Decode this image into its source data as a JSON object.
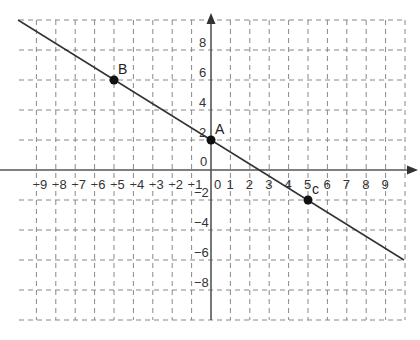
{
  "chart_data": {
    "type": "line",
    "title": "",
    "xlabel": "",
    "ylabel": "",
    "xlim": [
      -10,
      10
    ],
    "ylim": [
      -10,
      10
    ],
    "grid": true,
    "grid_style": "dashed",
    "x_ticks": [
      -9,
      -8,
      -7,
      -6,
      -5,
      -4,
      -3,
      -2,
      -1,
      0,
      1,
      2,
      3,
      4,
      5,
      6,
      7,
      8,
      9
    ],
    "x_tick_labels": [
      "-9",
      "-8",
      "-7",
      "-6",
      "-5",
      "-4",
      "-3",
      "-2",
      "-1",
      "0",
      "1",
      "2",
      "3",
      "4",
      "5",
      "6",
      "7",
      "8",
      "9"
    ],
    "y_ticks": [
      8,
      6,
      4,
      2,
      0,
      -2,
      -4,
      -6,
      -8
    ],
    "y_tick_labels": [
      "8",
      "6",
      "4",
      "2",
      "0",
      "-2",
      "-4",
      "-6",
      "-8"
    ],
    "series": [
      {
        "name": "line",
        "equation": "y = -0.8x + 2",
        "x": [
          -10,
          10
        ],
        "y": [
          10,
          -6
        ]
      }
    ],
    "points": [
      {
        "label": "A",
        "x": 0,
        "y": 2
      },
      {
        "label": "B",
        "x": -5,
        "y": 6
      },
      {
        "label": "C",
        "x": 5,
        "y": -2
      }
    ],
    "colors": {
      "line": "#333333",
      "grid": "#888888",
      "axis": "#555555",
      "point": "#111111"
    }
  }
}
